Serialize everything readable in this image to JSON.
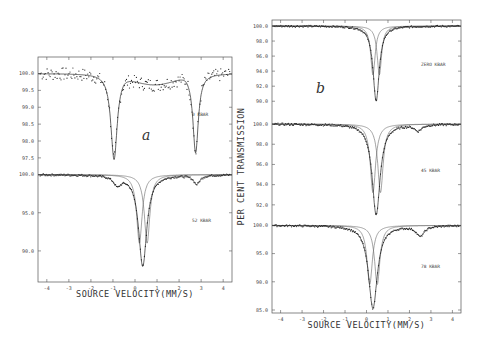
{
  "chart_data": [
    {
      "type": "scatter",
      "panel": "a",
      "panel_letter": "a",
      "xlabel": "SOURCE VELOCITY(MM/S)",
      "ylabel": "",
      "x_ticks": [
        "-4",
        "-3",
        "-2",
        "-1",
        "0",
        "1",
        "2",
        "3",
        "4"
      ],
      "xlim": [
        -4.4,
        4.4
      ],
      "subplots": [
        {
          "label": "0 KBAR",
          "ylim": [
            97.2,
            100.4
          ],
          "y_ticks": [
            "100.0",
            "99.5",
            "99.0",
            "98.5",
            "98.0",
            "97.5"
          ],
          "baseline": 100.0,
          "peaks": [
            {
              "position": -0.95,
              "depth_min": 97.45,
              "width": 0.35
            },
            {
              "position": 2.75,
              "depth_min": 97.65,
              "width": 0.3
            }
          ],
          "note": "doublet, sloped baseline with broad shoulder near 1.0 mm/s (~99.65)"
        },
        {
          "label": "52 KBAR",
          "ylim": [
            87.5,
            100.6
          ],
          "y_ticks": [
            "100.0",
            "95.0",
            "90.0"
          ],
          "baseline": 100.0,
          "peaks": [
            {
              "position": 0.35,
              "depth_min": 88.0,
              "width": 0.45,
              "component": "total"
            },
            {
              "position": 0.2,
              "depth_min": 91.0,
              "width": 0.3,
              "component": "fit-1"
            },
            {
              "position": 0.55,
              "depth_min": 91.0,
              "width": 0.3,
              "component": "fit-2"
            },
            {
              "position": -0.8,
              "depth_min": 98.8,
              "width": 0.4,
              "component": "minor"
            },
            {
              "position": 2.8,
              "depth_min": 98.8,
              "width": 0.35,
              "component": "minor"
            }
          ]
        }
      ]
    },
    {
      "type": "scatter",
      "panel": "b",
      "panel_letter": "b",
      "xlabel": "SOURCE VELOCITY(MM/S)",
      "ylabel": "PER CENT TRANSMISSION",
      "x_ticks": [
        "-4",
        "-3",
        "-2",
        "-1",
        "0",
        "1",
        "2",
        "3",
        "4"
      ],
      "xlim": [
        -4.4,
        4.4
      ],
      "subplots": [
        {
          "label": "ZERO KBAR",
          "ylim": [
            89.5,
            100.4
          ],
          "y_ticks": [
            "100.0",
            "98.0",
            "96.0",
            "94.0",
            "92.0",
            "90.0"
          ],
          "baseline": 100.0,
          "peaks": [
            {
              "position": 0.45,
              "depth_min": 90.0,
              "width": 0.35,
              "component": "total"
            },
            {
              "position": 0.3,
              "depth_min": 93.5,
              "width": 0.25,
              "component": "fit-1"
            },
            {
              "position": 0.6,
              "depth_min": 93.5,
              "width": 0.25,
              "component": "fit-2"
            }
          ]
        },
        {
          "label": "45 KBAR",
          "ylim": [
            90.5,
            100.4
          ],
          "y_ticks": [
            "100.0",
            "98.0",
            "96.0",
            "94.0",
            "92.0"
          ],
          "baseline": 100.0,
          "peaks": [
            {
              "position": 0.45,
              "depth_min": 91.0,
              "width": 0.45,
              "component": "total"
            },
            {
              "position": 0.3,
              "depth_min": 93.2,
              "width": 0.3,
              "component": "fit-1"
            },
            {
              "position": 0.65,
              "depth_min": 93.2,
              "width": 0.3,
              "component": "fit-2"
            },
            {
              "position": 2.4,
              "depth_min": 99.4,
              "width": 0.4,
              "component": "minor"
            }
          ]
        },
        {
          "label": "78 KBAR",
          "ylim": [
            85.0,
            100.6
          ],
          "y_ticks": [
            "100.0",
            "95.0",
            "90.0",
            "85.0"
          ],
          "baseline": 100.0,
          "peaks": [
            {
              "position": 0.3,
              "depth_min": 85.3,
              "width": 0.5,
              "component": "total"
            },
            {
              "position": 0.15,
              "depth_min": 89.5,
              "width": 0.3,
              "component": "fit-1"
            },
            {
              "position": 0.5,
              "depth_min": 89.5,
              "width": 0.3,
              "component": "fit-2"
            },
            {
              "position": 2.5,
              "depth_min": 98.2,
              "width": 0.45,
              "component": "minor"
            }
          ]
        }
      ]
    }
  ]
}
